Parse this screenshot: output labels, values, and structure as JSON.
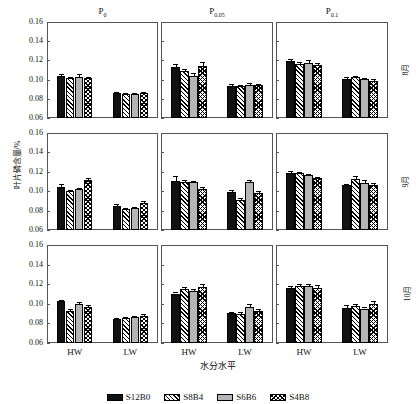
{
  "chart_data": {
    "type": "bar",
    "title": "",
    "xlabel": "水分水平",
    "ylabel": "叶片磷含量/%",
    "ylim": [
      0.06,
      0.16
    ],
    "yticks": [
      "0.06",
      "0.08",
      "0.10",
      "0.12",
      "0.14",
      "0.16"
    ],
    "grid": false,
    "legend_position": "bottom",
    "categories": [
      "HW",
      "LW"
    ],
    "series_names": [
      "S12B0",
      "S8B4",
      "S6B6",
      "S4B8"
    ],
    "column_titles": [
      {
        "base": "P",
        "sub": "0"
      },
      {
        "base": "P",
        "sub": "0.05"
      },
      {
        "base": "P",
        "sub": "0.1"
      }
    ],
    "row_titles": [
      "8月",
      "9月",
      "10月"
    ],
    "panels": [
      {
        "row": "8月",
        "col": "P0",
        "groups": [
          {
            "category": "HW",
            "values": [
              0.104,
              0.1015,
              0.1032,
              0.1012
            ],
            "errors": [
              0.0015,
              0.0012,
              0.0022,
              0.001
            ]
          },
          {
            "category": "LW",
            "values": [
              0.0863,
              0.0853,
              0.0853,
              0.086
            ],
            "errors": [
              0.0012,
              0.0008,
              0.0008,
              0.001
            ]
          }
        ]
      },
      {
        "row": "8月",
        "col": "P0.05",
        "groups": [
          {
            "category": "HW",
            "values": [
              0.1128,
              0.1093,
              0.1042,
              0.1138
            ],
            "errors": [
              0.0038,
              0.0022,
              0.0028,
              0.0042
            ]
          },
          {
            "category": "LW",
            "values": [
              0.0937,
              0.0933,
              0.0948,
              0.0945
            ],
            "errors": [
              0.0014,
              0.001,
              0.0012,
              0.0014
            ]
          }
        ]
      },
      {
        "row": "8月",
        "col": "P0.1",
        "groups": [
          {
            "category": "HW",
            "values": [
              0.1196,
              0.116,
              0.1176,
              0.115
            ],
            "errors": [
              0.0022,
              0.002,
              0.0026,
              0.0028
            ]
          },
          {
            "category": "LW",
            "values": [
              0.1008,
              0.1025,
              0.1002,
              0.099
            ],
            "errors": [
              0.002,
              0.001,
              0.0014,
              0.0016
            ]
          }
        ]
      },
      {
        "row": "9月",
        "col": "P0",
        "groups": [
          {
            "category": "HW",
            "values": [
              0.1045,
              0.1,
              0.102,
              0.1118
            ],
            "errors": [
              0.0032,
              0.0014,
              0.0014,
              0.0018
            ]
          },
          {
            "category": "LW",
            "values": [
              0.085,
              0.082,
              0.0825,
              0.088
            ],
            "errors": [
              0.0014,
              0.001,
              0.001,
              0.0014
            ]
          }
        ]
      },
      {
        "row": "9月",
        "col": "P0.05",
        "groups": [
          {
            "category": "HW",
            "values": [
              0.1107,
              0.1095,
              0.109,
              0.1022
            ],
            "errors": [
              0.0048,
              0.002,
              0.0018,
              0.0018
            ]
          },
          {
            "category": "LW",
            "values": [
              0.099,
              0.091,
              0.1098,
              0.0985
            ],
            "errors": [
              0.0018,
              0.0016,
              0.002,
              0.0022
            ]
          }
        ]
      },
      {
        "row": "9月",
        "col": "P0.1",
        "groups": [
          {
            "category": "HW",
            "values": [
              0.119,
              0.1185,
              0.1165,
              0.1132
            ],
            "errors": [
              0.002,
              0.0018,
              0.0014,
              0.0012
            ]
          },
          {
            "category": "LW",
            "values": [
              0.1062,
              0.113,
              0.1088,
              0.106
            ],
            "errors": [
              0.0016,
              0.0024,
              0.0028,
              0.002
            ]
          }
        ]
      },
      {
        "row": "10月",
        "col": "P0",
        "groups": [
          {
            "category": "HW",
            "values": [
              0.1028,
              0.093,
              0.1002,
              0.0972
            ],
            "errors": [
              0.0012,
              0.0012,
              0.0014,
              0.0012
            ]
          },
          {
            "category": "LW",
            "values": [
              0.0842,
              0.0855,
              0.0862,
              0.0878
            ],
            "errors": [
              0.0016,
              0.001,
              0.001,
              0.0014
            ]
          }
        ]
      },
      {
        "row": "10月",
        "col": "P0.05",
        "groups": [
          {
            "category": "HW",
            "values": [
              0.1105,
              0.1148,
              0.1128,
              0.1176
            ],
            "errors": [
              0.0014,
              0.0022,
              0.002,
              0.0022
            ]
          },
          {
            "category": "LW",
            "values": [
              0.0905,
              0.09,
              0.0968,
              0.0928
            ],
            "errors": [
              0.001,
              0.0016,
              0.003,
              0.0024
            ]
          }
        ]
      },
      {
        "row": "10月",
        "col": "P0.1",
        "groups": [
          {
            "category": "HW",
            "values": [
              0.1162,
              0.1178,
              0.1186,
              0.1165
            ],
            "errors": [
              0.0018,
              0.0026,
              0.0014,
              0.0028
            ]
          },
          {
            "category": "LW",
            "values": [
              0.0958,
              0.0978,
              0.0952,
              0.1
            ],
            "errors": [
              0.0028,
              0.0018,
              0.0018,
              0.0026
            ]
          }
        ]
      }
    ]
  },
  "legend": {
    "items": [
      {
        "label": "S12B0",
        "pattern": "solid-black",
        "color": "#111111"
      },
      {
        "label": "S8B4",
        "pattern": "diagonal-hatch",
        "color": "#ffffff"
      },
      {
        "label": "S6B6",
        "pattern": "solid-gray",
        "color": "#b5b5b5"
      },
      {
        "label": "S4B8",
        "pattern": "cross-hatch",
        "color": "#ffffff"
      }
    ]
  }
}
